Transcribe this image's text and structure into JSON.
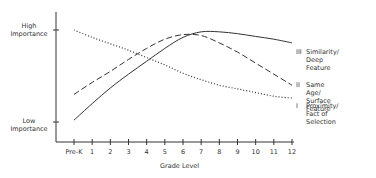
{
  "chart_data": {
    "type": "line",
    "title": "",
    "xlabel": "Grade Level",
    "ylabel": "",
    "x": [
      "Pre-K",
      "1",
      "2",
      "3",
      "4",
      "5",
      "6",
      "7",
      "8",
      "9",
      "10",
      "11",
      "12"
    ],
    "y_tick_labels": {
      "high": "High Importance",
      "low": "Low Importance"
    },
    "ylim": [
      0,
      1
    ],
    "grid": false,
    "legend_position": "right, inline at line ends",
    "series": [
      {
        "id": "III",
        "name": "Similarity/ Deep Feature",
        "style": "solid",
        "values": [
          0.02,
          0.2,
          0.37,
          0.52,
          0.66,
          0.8,
          0.92,
          0.98,
          0.98,
          0.96,
          0.93,
          0.9,
          0.86
        ]
      },
      {
        "id": "II",
        "name": "Same Age/ Surface Feature",
        "style": "dashed",
        "values": [
          0.3,
          0.43,
          0.55,
          0.68,
          0.8,
          0.9,
          0.95,
          0.94,
          0.86,
          0.76,
          0.64,
          0.52,
          0.4
        ]
      },
      {
        "id": "I",
        "name": "Proximity/ Fact of Selection",
        "style": "dotted",
        "values": [
          1.0,
          0.92,
          0.85,
          0.78,
          0.7,
          0.62,
          0.53,
          0.46,
          0.4,
          0.36,
          0.32,
          0.28,
          0.26
        ]
      }
    ]
  },
  "axis": {
    "high_line1": "High",
    "high_line2": "Importance",
    "low_line1": "Low",
    "low_line2": "Importance",
    "xlabel": "Grade Level",
    "ticks": [
      "Pre-K",
      "1",
      "2",
      "3",
      "4",
      "5",
      "6",
      "7",
      "8",
      "9",
      "10",
      "11",
      "12"
    ]
  },
  "legend": [
    {
      "num": "III",
      "line1": "Similarity/",
      "line2": "Deep Feature"
    },
    {
      "num": "II",
      "line1": "Same Age/",
      "line2": "Surface Feature"
    },
    {
      "num": "I",
      "line1": "Proximity/",
      "line2": "Fact of Selection"
    }
  ]
}
